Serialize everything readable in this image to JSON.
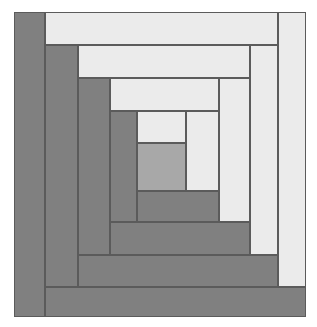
{
  "artwork": {
    "title": "Log Cabin Quilt Block",
    "pattern_name": "log-cabin",
    "canvas": {
      "width": 317,
      "height": 327,
      "background": "#ffffff"
    },
    "block_bounds": {
      "x": 14,
      "y": 12,
      "width": 292,
      "height": 305
    },
    "palette": {
      "dark": "#808080",
      "dark_alt": "#848484",
      "light": "#ebebeb",
      "light_alt": "#e6e6e6",
      "center": "#a8a8a8",
      "seam": "#5b5b5b",
      "background": "#ffffff"
    },
    "grid": {
      "x_lines": [
        14,
        45,
        78,
        110,
        137,
        186,
        219,
        250,
        278,
        306
      ],
      "y_lines": [
        12,
        45,
        78,
        111,
        143,
        191,
        222,
        255,
        287,
        317
      ]
    },
    "rounds": 5,
    "patches": [
      {
        "name": "center-square",
        "round": 0,
        "value": "center",
        "color": "#a8a8a8",
        "x": 137,
        "y": 143,
        "w": 49,
        "h": 48
      },
      {
        "name": "round1-light-top",
        "round": 1,
        "value": "light",
        "color": "#ebebeb",
        "x": 137,
        "y": 111,
        "w": 49,
        "h": 32
      },
      {
        "name": "round1-light-right",
        "round": 1,
        "value": "light",
        "color": "#ebebeb",
        "x": 186,
        "y": 111,
        "w": 33,
        "h": 80
      },
      {
        "name": "round1-dark-bottom",
        "round": 1,
        "value": "dark",
        "color": "#808080",
        "x": 137,
        "y": 191,
        "w": 82,
        "h": 31
      },
      {
        "name": "round1-dark-left",
        "round": 1,
        "value": "dark",
        "color": "#808080",
        "x": 110,
        "y": 111,
        "w": 27,
        "h": 111
      },
      {
        "name": "round2-light-top",
        "round": 2,
        "value": "light",
        "color": "#ebebeb",
        "x": 110,
        "y": 78,
        "w": 109,
        "h": 33
      },
      {
        "name": "round2-light-right",
        "round": 2,
        "value": "light",
        "color": "#ebebeb",
        "x": 219,
        "y": 78,
        "w": 31,
        "h": 144
      },
      {
        "name": "round2-dark-bottom",
        "round": 2,
        "value": "dark",
        "color": "#808080",
        "x": 110,
        "y": 222,
        "w": 140,
        "h": 33
      },
      {
        "name": "round2-dark-left",
        "round": 2,
        "value": "dark",
        "color": "#808080",
        "x": 78,
        "y": 78,
        "w": 32,
        "h": 177
      },
      {
        "name": "round3-light-top",
        "round": 3,
        "value": "light",
        "color": "#ebebeb",
        "x": 78,
        "y": 45,
        "w": 172,
        "h": 33
      },
      {
        "name": "round3-light-right",
        "round": 3,
        "value": "light",
        "color": "#ebebeb",
        "x": 250,
        "y": 45,
        "w": 28,
        "h": 210
      },
      {
        "name": "round3-dark-bottom",
        "round": 3,
        "value": "dark",
        "color": "#808080",
        "x": 78,
        "y": 255,
        "w": 200,
        "h": 32
      },
      {
        "name": "round3-dark-left",
        "round": 3,
        "value": "dark",
        "color": "#808080",
        "x": 45,
        "y": 45,
        "w": 33,
        "h": 242
      },
      {
        "name": "round4-light-top",
        "round": 4,
        "value": "light",
        "color": "#ebebeb",
        "x": 45,
        "y": 12,
        "w": 233,
        "h": 33
      },
      {
        "name": "round4-light-right",
        "round": 4,
        "value": "light",
        "color": "#ebebeb",
        "x": 278,
        "y": 12,
        "w": 28,
        "h": 275
      },
      {
        "name": "round4-dark-bottom",
        "round": 4,
        "value": "dark",
        "color": "#808080",
        "x": 45,
        "y": 287,
        "w": 261,
        "h": 30
      },
      {
        "name": "round4-dark-left",
        "round": 4,
        "value": "dark",
        "color": "#808080",
        "x": 14,
        "y": 12,
        "w": 31,
        "h": 305
      }
    ]
  }
}
